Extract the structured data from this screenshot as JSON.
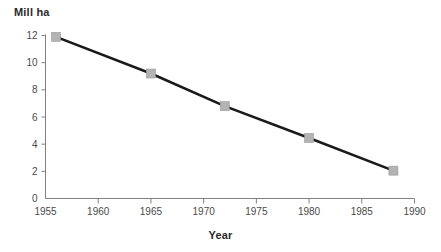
{
  "chart_data": {
    "type": "line",
    "title": "",
    "subtitle": "",
    "xlabel": "Year",
    "ylabel": "Mill ha",
    "x": [
      1956,
      1965,
      1972,
      1980,
      1988
    ],
    "values": [
      11.9,
      9.2,
      6.8,
      4.45,
      2.05
    ],
    "series": [
      {
        "name": "Mill ha",
        "x": [
          1956,
          1965,
          1972,
          1980,
          1988
        ],
        "values": [
          11.9,
          9.2,
          6.8,
          4.45,
          2.05
        ]
      }
    ],
    "xlim": [
      1955,
      1990
    ],
    "ylim": [
      0,
      12
    ],
    "xticks": [
      1955,
      1960,
      1965,
      1970,
      1975,
      1980,
      1985,
      1990
    ],
    "yticks": [
      0,
      2,
      4,
      6,
      8,
      10,
      12
    ],
    "xtick_labels": [
      "1955",
      "1960",
      "1965",
      "1970",
      "1975",
      "1980",
      "1985",
      "1990"
    ],
    "ytick_labels": [
      "0",
      "2",
      "4",
      "6",
      "8",
      "10",
      "12"
    ],
    "grid": false,
    "legend": false,
    "legend_position": "none",
    "marker": "square",
    "marker_color": "#b3b3b3",
    "line_color": "#1a1a1a",
    "axis_color": "#808080",
    "background_color": "#ffffff"
  },
  "axes": {
    "y_title": "Mill ha",
    "x_title": "Year"
  }
}
